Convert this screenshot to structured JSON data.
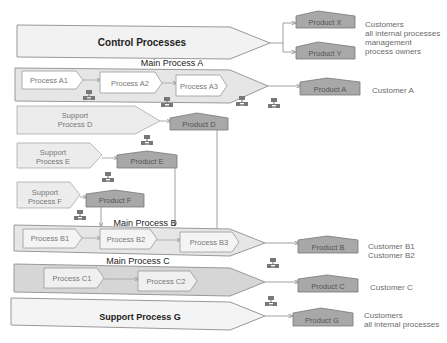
{
  "control": {
    "label": "Control Processes",
    "products": [
      "Product X",
      "Product Y"
    ],
    "customers": [
      "Customers",
      "all internal processes",
      "management",
      "process owners"
    ]
  },
  "main_a": {
    "title": "Main Process A",
    "steps": [
      "Process A1",
      "Process A2",
      "Process A3"
    ],
    "product": "Product A",
    "customer": "Customer A"
  },
  "support_d": {
    "label_lines": [
      "Support",
      "Process D"
    ],
    "product": "Product D"
  },
  "support_e": {
    "label_lines": [
      "Support",
      "Process E"
    ],
    "product": "Product E"
  },
  "support_f": {
    "label_lines": [
      "Support",
      "Process F"
    ],
    "product": "Product F"
  },
  "main_b": {
    "title": "Main Process B",
    "steps": [
      "Process B1",
      "Process B2",
      "Process B3"
    ],
    "product": "Product B",
    "customers": [
      "Customer B1",
      "Customer B2"
    ]
  },
  "main_c": {
    "title": "Main Process C",
    "steps": [
      "Process C1",
      "Process C2"
    ],
    "product": "Product C",
    "customer": "Customer C"
  },
  "support_g": {
    "label": "Support Process G",
    "product": "Product G",
    "customers": [
      "Customers",
      "all internal processes"
    ]
  },
  "colors": {
    "chevron_fill": "#f0f0f0",
    "band_fill": "#e0e0e0",
    "band_c_fill": "#d4d4d4",
    "product_fill": "#a8a8a8",
    "stroke": "#8a8a8a",
    "text": "#6b6b6b"
  }
}
